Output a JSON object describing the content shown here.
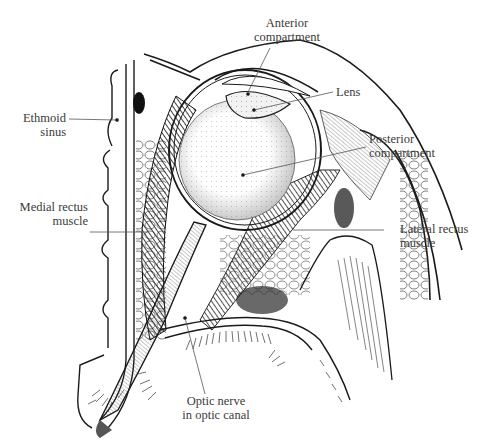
{
  "figure": {
    "labels": {
      "anterior_compartment": {
        "line1": "Anterior",
        "line2": "compartment"
      },
      "lens": {
        "line1": "Lens"
      },
      "ethmoid_sinus": {
        "line1": "Ethmoid",
        "line2": "sinus"
      },
      "posterior_compartment": {
        "line1": "Posterior",
        "line2": "compartment"
      },
      "medial_rectus": {
        "line1": "Medial rectus",
        "line2": "muscle"
      },
      "lateral_rectus": {
        "line1": "Lateral rectus",
        "line2": "muscle"
      },
      "optic_nerve": {
        "line1": "Optic nerve",
        "line2": "in optic canal"
      }
    },
    "colors": {
      "ink": "#1a1a1a",
      "label_text": "#3a3a3a",
      "leader_line": "#555555",
      "background": "#ffffff"
    }
  }
}
